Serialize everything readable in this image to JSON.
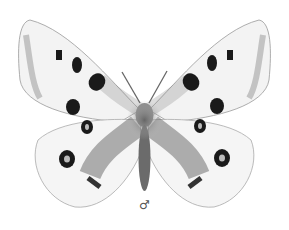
{
  "image": {
    "subject": "butterfly illustration",
    "caption_symbol": "♂",
    "colors": {
      "background": "#ffffff",
      "wing": "#f2f2f2",
      "spot": "#1a1a1a",
      "body": "#555555",
      "shading": "#888888"
    }
  }
}
